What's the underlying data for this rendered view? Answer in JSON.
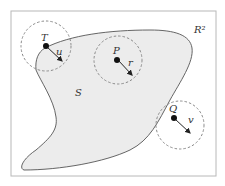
{
  "diagram": {
    "space_label": "R²",
    "set_label": "S",
    "colors": {
      "frame": "#b8b8b8",
      "set_fill": "#ececec",
      "set_stroke": "#555555",
      "circle": "#8a8a8a",
      "point": "#111111",
      "arrow": "#222222"
    },
    "points": [
      {
        "name": "T",
        "vector": "u",
        "location": "on boundary of S"
      },
      {
        "name": "P",
        "vector": "r",
        "location": "interior of S"
      },
      {
        "name": "Q",
        "vector": "v",
        "location": "exterior of S"
      }
    ]
  }
}
